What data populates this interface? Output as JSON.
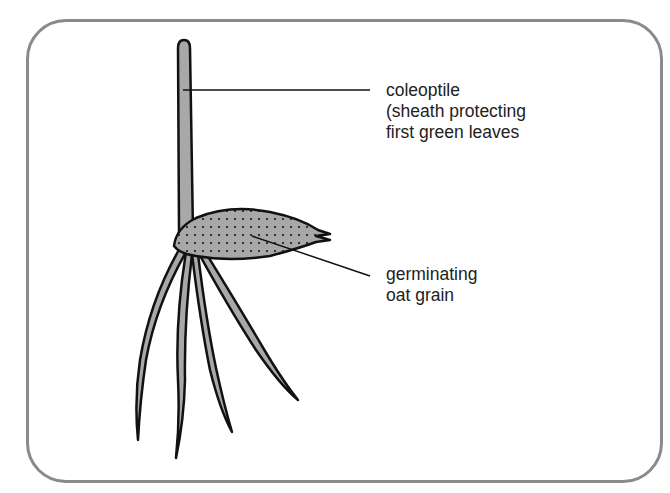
{
  "diagram": {
    "labels": {
      "coleoptile": {
        "lines": [
          "coleoptile",
          "(sheath protecting",
          "first green leaves"
        ]
      },
      "grain": {
        "lines": [
          "germinating",
          "oat grain"
        ]
      }
    },
    "colors": {
      "frame": "#8a8a8a",
      "fill": "#a8a8a8",
      "outline": "#111111",
      "stipple": "#333333",
      "text": "#222222"
    }
  }
}
